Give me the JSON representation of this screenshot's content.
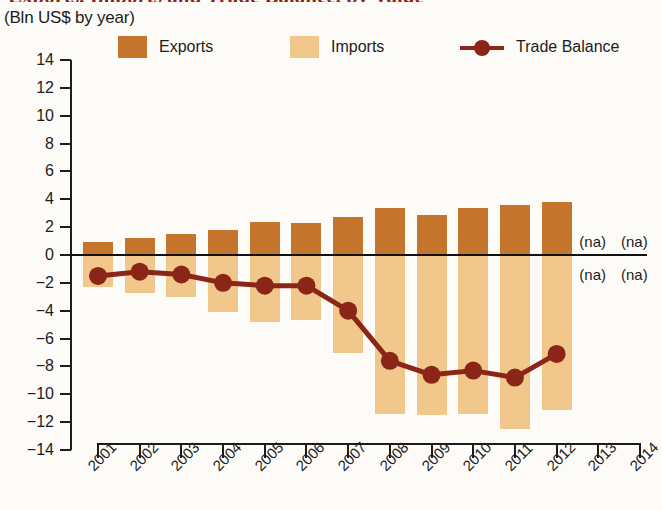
{
  "title": "Exports, Imports and Trade Balance, by Value",
  "subtitle": "(Bln US$ by year)",
  "colors": {
    "exports": "#C4742B",
    "imports": "#F1C78B",
    "trade_balance": "#8B2518",
    "axis": "#1c1c1c",
    "background": "#fdfbf7"
  },
  "legend": {
    "position": "top",
    "items": [
      {
        "label": "Exports",
        "marker": "square-swatch",
        "color": "#C4742B"
      },
      {
        "label": "Imports",
        "marker": "square-swatch",
        "color": "#F1C78B"
      },
      {
        "label": "Trade Balance",
        "marker": "line-with-circle",
        "color": "#8B2518"
      }
    ]
  },
  "annotations": [
    {
      "text": "(na)",
      "x_category": "2013",
      "y_value": 0.9
    },
    {
      "text": "(na)",
      "x_category": "2014",
      "y_value": 0.9
    },
    {
      "text": "(na)",
      "x_category": "2013",
      "y_value": -1.4
    },
    {
      "text": "(na)",
      "x_category": "2014",
      "y_value": -1.4
    }
  ],
  "axis": {
    "y_ticks": [
      14,
      12,
      10,
      8,
      6,
      4,
      2,
      0,
      -2,
      -4,
      -6,
      -8,
      -10,
      -12,
      -14
    ],
    "y_tick_labels": [
      "14",
      "12",
      "10",
      "8",
      "6",
      "4",
      "2",
      "0",
      "−2",
      "−4",
      "−6",
      "−8",
      "−10",
      "−12",
      "−14"
    ],
    "x_tick_labels": [
      "2001",
      "2002",
      "2003",
      "2004",
      "2005",
      "2006",
      "2007",
      "2008",
      "2009",
      "2010",
      "2011",
      "2012",
      "2013",
      "2014"
    ]
  },
  "chart_data": {
    "type": "bar",
    "title": "Exports, Imports and Trade Balance, by Value",
    "subtitle": "(Bln US$ by year)",
    "xlabel": "",
    "ylabel": "Bln US$",
    "ylim": [
      -14,
      14
    ],
    "grid": false,
    "legend_position": "top",
    "categories": [
      "2001",
      "2002",
      "2003",
      "2004",
      "2005",
      "2006",
      "2007",
      "2008",
      "2009",
      "2010",
      "2011",
      "2012",
      "2013",
      "2014"
    ],
    "series": [
      {
        "name": "Exports",
        "type": "bar",
        "color": "#C4742B",
        "values": [
          0.9,
          1.2,
          1.5,
          1.8,
          2.4,
          2.3,
          2.7,
          3.4,
          2.9,
          3.4,
          3.6,
          3.8,
          null,
          null
        ]
      },
      {
        "name": "Imports",
        "type": "bar",
        "color": "#F1C78B",
        "values": [
          -2.3,
          -2.7,
          -3.0,
          -4.1,
          -4.8,
          -4.7,
          -7.0,
          -11.4,
          -11.5,
          -11.4,
          -12.5,
          -11.1,
          null,
          null
        ]
      },
      {
        "name": "Trade Balance",
        "type": "line",
        "color": "#8B2518",
        "values": [
          -1.5,
          -1.2,
          -1.4,
          -2.0,
          -2.2,
          -2.2,
          -4.0,
          -7.6,
          -8.6,
          -8.3,
          -8.8,
          -7.1,
          null,
          null
        ]
      }
    ]
  }
}
